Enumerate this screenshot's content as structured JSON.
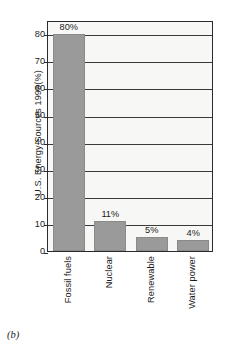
{
  "caption": "(b)",
  "chart_data": {
    "type": "bar",
    "title": "",
    "xlabel": "",
    "ylabel": "U.S. Energy Sources 1999(%)",
    "categories": [
      "Fossil fuels",
      "Nuclear",
      "Renewable",
      "Water power"
    ],
    "values": [
      80,
      11,
      5,
      4
    ],
    "value_labels": [
      "80%",
      "11%",
      "5%",
      "4%"
    ],
    "ylim": [
      0,
      85
    ],
    "yticks": [
      0,
      10,
      20,
      30,
      40,
      50,
      60,
      70,
      80
    ],
    "ytick_labels": [
      "0",
      "10",
      "20",
      "30",
      "40",
      "50",
      "60",
      "70",
      "80"
    ],
    "grid": true,
    "legend": null,
    "bar_color": "#9a9a9a",
    "plot_background": "#f7f7f5",
    "axis_color": "#2b2b2b",
    "gridline_color": "#3a3a3a"
  }
}
